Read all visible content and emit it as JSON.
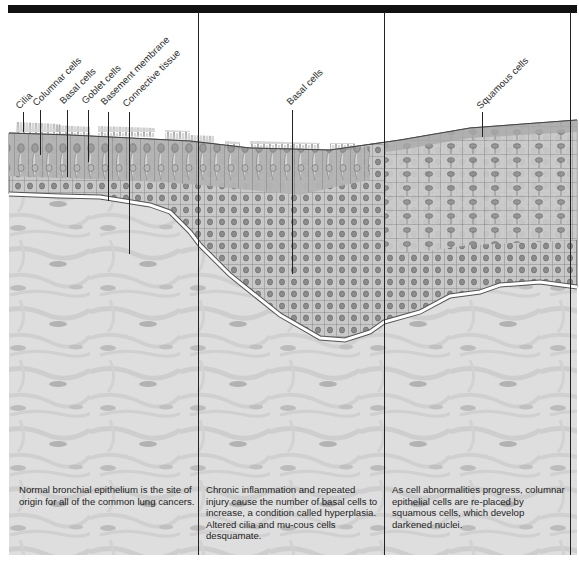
{
  "figure": {
    "panels": [
      {
        "id": "normal",
        "caption": "Normal bronchial epithelium is the site of origin for all of the common lung cancers.",
        "labels": [
          "Cilia",
          "Columnar cells",
          "Basal cells",
          "Goblet cells",
          "Basement membrane",
          "Connective tissue"
        ]
      },
      {
        "id": "hyperplasia",
        "caption": "Chronic inflammation and repeated injury cause the number of basal cells to increase, a condition called hyperplasia. Altered cilia and mu-cous cells desquamate.",
        "labels": [
          "Basal cells"
        ]
      },
      {
        "id": "metaplasia",
        "caption": "As cell abnormalities progress, columnar epithelial cells are re-placed by squamous cells, which develop darkened nuclei.",
        "labels": [
          "Squamous cells"
        ]
      }
    ],
    "colors": {
      "top_bar": "#111111",
      "connective_tissue": "#dcdcdc",
      "fiber": "#c9c9c9",
      "fibroblast": "#a9a9a9",
      "epithelium_columnar": "#a8a8a8",
      "epithelium_basal": "#cfcfcf",
      "squamous": "#bdbdbd",
      "nucleus": "#8a8a8a",
      "basement_membrane": "#ffffff"
    }
  }
}
